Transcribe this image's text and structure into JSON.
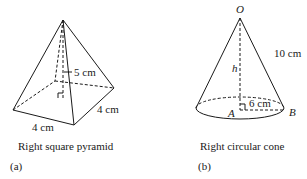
{
  "figure_a": {
    "dimension_height": "5 cm",
    "dimension_side_right": "4 cm",
    "dimension_side_front": "4 cm",
    "caption": "Right square pyramid",
    "panel_label": "(a)"
  },
  "figure_b": {
    "apex_label": "O",
    "slant_label": "10 cm",
    "height_label": "h",
    "radius_label": "6 cm",
    "center_label": "A",
    "edge_point_label": "B",
    "caption": "Right circular cone",
    "panel_label": "(b)"
  },
  "colors": {
    "stroke": "#1a1a1a",
    "background": "#ffffff"
  }
}
